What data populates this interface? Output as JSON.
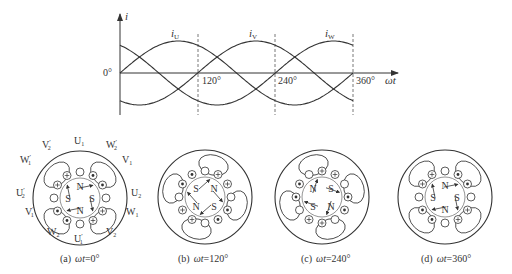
{
  "chart_data": {
    "type": "line",
    "title": "",
    "xlabel": "ωt",
    "ylabel": "i",
    "x_ticks": [
      "0°",
      "120°",
      "240°",
      "360°"
    ],
    "x_range_deg": [
      0,
      360
    ],
    "series": [
      {
        "name": "iU",
        "label": "i",
        "sub": "U",
        "phase_deg": 0,
        "formula": "sin(ωt)"
      },
      {
        "name": "iV",
        "label": "i",
        "sub": "V",
        "phase_deg": 120,
        "formula": "sin(ωt-120°)"
      },
      {
        "name": "iW",
        "label": "i",
        "sub": "W",
        "phase_deg": 240,
        "formula": "sin(ωt-240°)"
      }
    ],
    "dashed_vertical_lines_deg": [
      120,
      240,
      360
    ],
    "grid": false,
    "legend": "inline labels above curve peaks"
  },
  "axis": {
    "y_label": "i",
    "x_label": "ωt",
    "tick_0": "0°",
    "tick_120": "120°",
    "tick_240": "240°",
    "tick_360": "360°"
  },
  "curve_labels": {
    "u": {
      "main": "i",
      "sub": "U"
    },
    "v": {
      "main": "i",
      "sub": "V"
    },
    "w": {
      "main": "i",
      "sub": "W"
    }
  },
  "stator_labels": {
    "U1": {
      "main": "U",
      "sub": "1",
      "prime": ""
    },
    "U2": {
      "main": "U",
      "sub": "2",
      "prime": ""
    },
    "U1p": {
      "main": "U",
      "sub": "1",
      "prime": "′"
    },
    "U2p": {
      "main": "U",
      "sub": "2",
      "prime": "′"
    },
    "V1": {
      "main": "V",
      "sub": "1",
      "prime": ""
    },
    "V2": {
      "main": "V",
      "sub": "2",
      "prime": ""
    },
    "V1p": {
      "main": "V",
      "sub": "1",
      "prime": "′"
    },
    "V2p": {
      "main": "V",
      "sub": "2",
      "prime": "′"
    },
    "W1": {
      "main": "W",
      "sub": "1",
      "prime": ""
    },
    "W2": {
      "main": "W",
      "sub": "2",
      "prime": ""
    },
    "W1p": {
      "main": "W",
      "sub": "1",
      "prime": "′"
    },
    "W2p": {
      "main": "W",
      "sub": "2",
      "prime": "′"
    }
  },
  "panels": [
    {
      "id": "a",
      "caption_prefix": "(a)",
      "caption_var": "ωt",
      "caption_value": "=0°",
      "poles": {
        "top": "N",
        "right": "S",
        "bottom": "N",
        "left": "S"
      }
    },
    {
      "id": "b",
      "caption_prefix": "(b)",
      "caption_var": "ωt",
      "caption_value": "=120°",
      "poles": {
        "top-left": "S",
        "top-right": "N",
        "bottom-right": "S",
        "bottom-left": "N"
      }
    },
    {
      "id": "c",
      "caption_prefix": "(c)",
      "caption_var": "ωt",
      "caption_value": "=240°",
      "poles": {
        "top-left": "N",
        "top-right": "S",
        "bottom-right": "N",
        "bottom-left": "S"
      }
    },
    {
      "id": "d",
      "caption_prefix": "(d)",
      "caption_var": "ωt",
      "caption_value": "=360°",
      "poles": {
        "top": "N",
        "right": "S",
        "bottom": "N",
        "left": "S"
      }
    }
  ],
  "colors": {
    "line": "#333333",
    "dash": "#555555",
    "background": "#ffffff"
  }
}
